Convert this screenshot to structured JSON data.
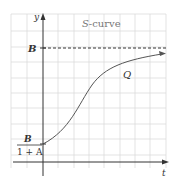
{
  "figure": {
    "title_italic": "S",
    "title_rest": "-curve",
    "y_axis_label": "y",
    "x_axis_label": "t",
    "asymptote_label": "B",
    "intercept_numerator": "B",
    "intercept_denominator": "1 + A",
    "curve_label": "Q",
    "colors": {
      "grid": "#d8d8d8",
      "axis": "#333333",
      "curve": "#555555"
    }
  }
}
